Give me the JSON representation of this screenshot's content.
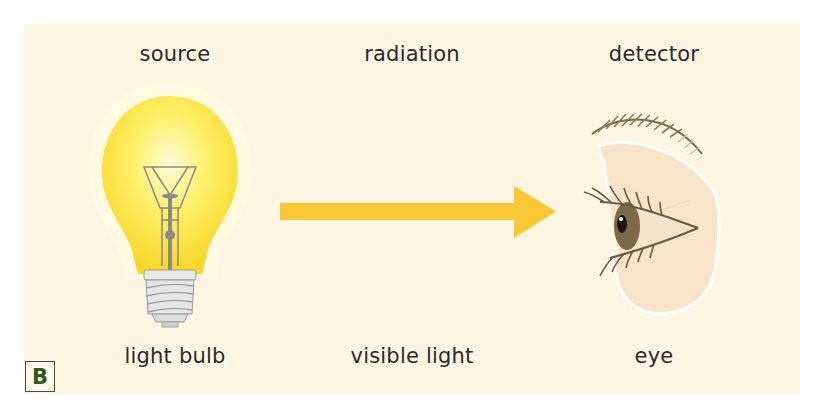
{
  "diagram": {
    "badge": "B",
    "columns": [
      {
        "role": "source",
        "example": "light bulb"
      },
      {
        "role": "radiation",
        "example": "visible light"
      },
      {
        "role": "detector",
        "example": "eye"
      }
    ]
  },
  "colors": {
    "background": "#fcf6e3",
    "arrow": "#f8c934",
    "bulb_glow": "#fef06a",
    "badge_text": "#2f5a1e"
  }
}
